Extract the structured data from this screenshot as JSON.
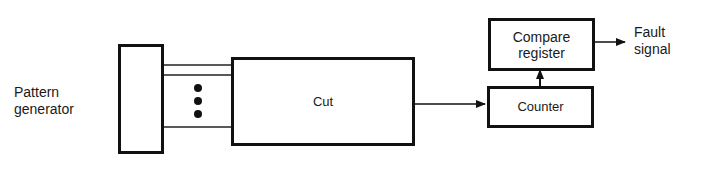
{
  "diagram": {
    "pattern_generator": {
      "label_line1": "Pattern",
      "label_line2": "generator"
    },
    "cut": {
      "label": "Cut"
    },
    "compare_register": {
      "label_line1": "Compare",
      "label_line2": "register"
    },
    "counter": {
      "label": "Counter"
    },
    "fault_signal": {
      "label_line1": "Fault",
      "label_line2": "signal"
    },
    "colors": {
      "stroke": "#111111",
      "background": "#ffffff"
    }
  }
}
